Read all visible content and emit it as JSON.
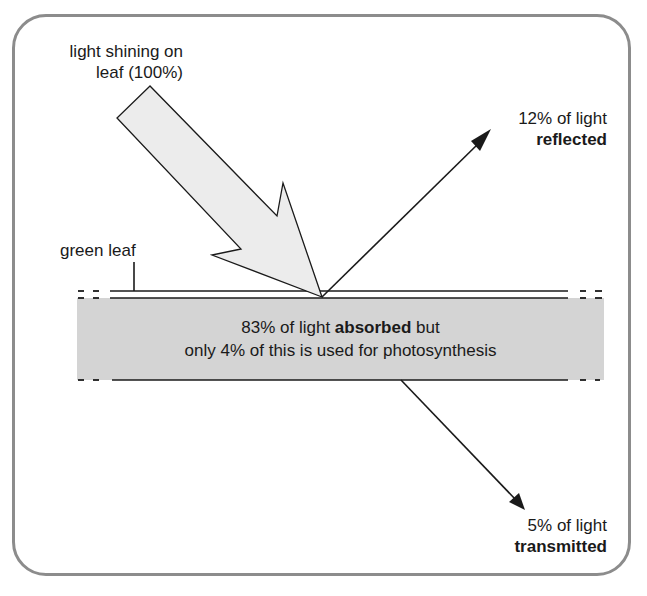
{
  "diagram": {
    "incident": {
      "line1": "light shining on",
      "line2": "leaf (100%)"
    },
    "reflected": {
      "line1": "12% of light",
      "line2": "reflected"
    },
    "leaf_label": "green leaf",
    "absorbed": {
      "pre": "83% of light ",
      "bold": "absorbed",
      "post": " but",
      "line2": "only 4% of this is used for photosynthesis"
    },
    "transmitted": {
      "line1": "5% of light",
      "line2": "transmitted"
    },
    "colors": {
      "frame": "#8c8c8c",
      "leaf_fill": "#d4d4d4",
      "arrow_fill": "#ececec",
      "line": "#1a1a1a"
    },
    "values": {
      "incident_percent": 100,
      "reflected_percent": 12,
      "absorbed_percent": 83,
      "photosynthesis_percent_of_absorbed": 4,
      "transmitted_percent": 5
    }
  }
}
